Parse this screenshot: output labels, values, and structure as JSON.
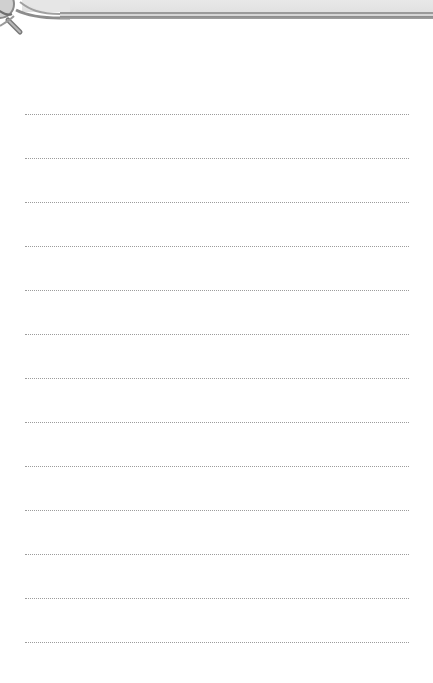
{
  "page": {
    "type": "lined-notepaper",
    "background_color": "#ffffff",
    "banner_color": "#e4e4e4",
    "line_color": "#9c9c9c"
  },
  "ruled_lines": {
    "count": 13,
    "start_x": 25,
    "end_x": 409,
    "y_positions": [
      114,
      158,
      202,
      246,
      290,
      334,
      378,
      422,
      466,
      510,
      554,
      598,
      642
    ]
  },
  "decorations": {
    "top_left_icon": "ring-pin-icon"
  }
}
